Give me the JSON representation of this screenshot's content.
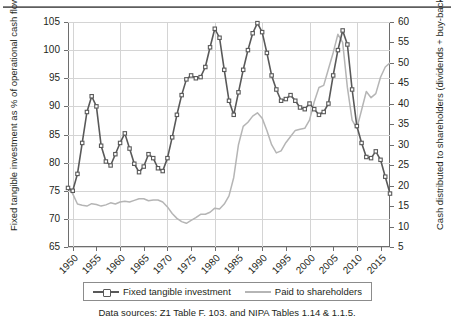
{
  "axes": {
    "left_title": "Fixed tangible investment as % of operational cash flow (profits after tax + depreciation).",
    "right_title": "Cash distributed to shareholders (dividends + buy-backs) as % of operational cash flow.",
    "left_ticks": [
      "105",
      "100",
      "95",
      "90",
      "85",
      "80",
      "75",
      "70",
      "65"
    ],
    "right_ticks": [
      "60",
      "55",
      "50",
      "45",
      "40",
      "35",
      "30",
      "25",
      "20",
      "15",
      "10",
      "5"
    ],
    "x_ticks": [
      "1950",
      "1955",
      "1960",
      "1965",
      "1970",
      "1975",
      "1980",
      "1985",
      "1990",
      "1995",
      "2000",
      "2005",
      "2010",
      "2015"
    ]
  },
  "legend": {
    "items": [
      {
        "label": "Fixed tangible investment",
        "color": "#595959",
        "marker": "square"
      },
      {
        "label": "Paid to shareholders",
        "color": "#b5b5b5",
        "marker": "none"
      }
    ]
  },
  "source_note": "Data sources: Z1 Table F. 103. and NIPA Tables 1.14 & 1.1.5.",
  "chart_data": {
    "type": "line",
    "title": "",
    "xlabel": "",
    "ylabel": "Fixed tangible investment as % of operational cash flow (profits after tax + depreciation).",
    "y2label": "Cash distributed to shareholders (dividends + buy-backs) as % of operational cash flow.",
    "xlim": [
      1949,
      2017
    ],
    "ylim": [
      65,
      105
    ],
    "y2lim": [
      5,
      60
    ],
    "ytick_step": 5,
    "y2tick_step": 5,
    "xtick_step": 5,
    "grid": "horizontal-and-vertical-decade",
    "legend_position": "below-plot",
    "series": [
      {
        "name": "Fixed tangible investment",
        "axis": "left",
        "color": "#595959",
        "marker": "square",
        "x": [
          1949,
          1950,
          1951,
          1952,
          1953,
          1954,
          1955,
          1956,
          1957,
          1958,
          1959,
          1960,
          1961,
          1962,
          1963,
          1964,
          1965,
          1966,
          1967,
          1968,
          1969,
          1970,
          1971,
          1972,
          1973,
          1974,
          1975,
          1976,
          1977,
          1978,
          1979,
          1980,
          1981,
          1982,
          1983,
          1984,
          1985,
          1986,
          1987,
          1988,
          1989,
          1990,
          1991,
          1992,
          1993,
          1994,
          1995,
          1996,
          1997,
          1998,
          1999,
          2000,
          2001,
          2002,
          2003,
          2004,
          2005,
          2006,
          2007,
          2008,
          2009,
          2010,
          2011,
          2012,
          2013,
          2014,
          2015,
          2016,
          2017
        ],
        "y": [
          75.5,
          75.0,
          78.0,
          83.5,
          89.0,
          91.8,
          90.0,
          83.0,
          80.2,
          79.5,
          81.5,
          83.5,
          85.2,
          82.5,
          79.8,
          78.3,
          79.3,
          81.5,
          80.8,
          79.0,
          78.5,
          80.8,
          84.5,
          88.5,
          92.0,
          94.8,
          95.5,
          95.0,
          95.2,
          97.0,
          100.5,
          103.8,
          102.2,
          96.5,
          91.0,
          88.5,
          92.5,
          96.5,
          100.0,
          103.0,
          104.8,
          103.2,
          99.5,
          95.5,
          93.0,
          91.0,
          91.3,
          92.0,
          91.0,
          89.8,
          89.5,
          90.5,
          89.5,
          88.5,
          89.0,
          90.5,
          95.5,
          100.0,
          103.5,
          101.0,
          93.0,
          86.5,
          83.5,
          81.0,
          80.8,
          82.0,
          80.5,
          77.5,
          74.5
        ]
      },
      {
        "name": "Paid to shareholders",
        "axis": "right",
        "color": "#b5b5b5",
        "marker": "none",
        "x": [
          1949,
          1950,
          1951,
          1952,
          1953,
          1954,
          1955,
          1956,
          1957,
          1958,
          1959,
          1960,
          1961,
          1962,
          1963,
          1964,
          1965,
          1966,
          1967,
          1968,
          1969,
          1970,
          1971,
          1972,
          1973,
          1974,
          1975,
          1976,
          1977,
          1978,
          1979,
          1980,
          1981,
          1982,
          1983,
          1984,
          1985,
          1986,
          1987,
          1988,
          1989,
          1990,
          1991,
          1992,
          1993,
          1994,
          1995,
          1996,
          1997,
          1998,
          1999,
          2000,
          2001,
          2002,
          2003,
          2004,
          2005,
          2006,
          2007,
          2008,
          2009,
          2010,
          2011,
          2012,
          2013,
          2014,
          2015,
          2016,
          2017
        ],
        "y": [
          19.5,
          18.0,
          15.5,
          15.2,
          15.0,
          15.6,
          15.4,
          15.0,
          15.3,
          15.8,
          15.5,
          16.0,
          16.2,
          16.0,
          16.4,
          16.8,
          16.8,
          16.3,
          16.5,
          16.5,
          16.0,
          14.8,
          13.2,
          12.0,
          11.2,
          10.8,
          11.5,
          12.2,
          13.0,
          13.0,
          13.5,
          14.5,
          14.3,
          15.5,
          17.5,
          22.0,
          30.0,
          34.5,
          35.5,
          37.0,
          37.8,
          36.5,
          33.5,
          30.0,
          28.0,
          28.5,
          30.5,
          32.0,
          33.5,
          33.8,
          34.0,
          36.0,
          40.5,
          44.0,
          44.5,
          48.5,
          52.5,
          57.0,
          55.0,
          44.0,
          36.0,
          34.0,
          38.5,
          43.0,
          41.5,
          42.5,
          46.5,
          49.0,
          50.0
        ]
      }
    ]
  }
}
